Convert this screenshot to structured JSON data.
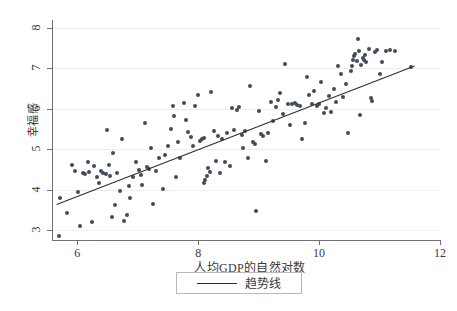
{
  "chart_data": {
    "type": "scatter",
    "title": "",
    "xlabel": "人均GDP的自然对数",
    "ylabel": "幸福感",
    "xlim": [
      5.6,
      12
    ],
    "ylim": [
      2.75,
      8.15
    ],
    "xticks": [
      6,
      8,
      10,
      12
    ],
    "yticks": [
      3,
      4,
      5,
      6,
      7,
      8
    ],
    "xtick_labels": [
      "6",
      "8",
      "10",
      "12"
    ],
    "ytick_labels": [
      "3",
      "4",
      "5",
      "6",
      "7",
      "8"
    ],
    "grid": "horizontal",
    "legend_position": "below-axis",
    "point_color": "#434a5a",
    "line_color": "#2e2e2e",
    "grid_color": "#ededed",
    "axis_color": "#6f6f6f",
    "series": [
      {
        "name": "观测值",
        "type": "scatter",
        "points": [
          [
            5.72,
            3.78
          ],
          [
            5.7,
            2.85
          ],
          [
            5.83,
            3.41
          ],
          [
            5.92,
            4.61
          ],
          [
            5.96,
            4.47
          ],
          [
            6.02,
            3.94
          ],
          [
            6.05,
            3.09
          ],
          [
            6.1,
            4.41
          ],
          [
            6.13,
            4.38
          ],
          [
            6.18,
            4.68
          ],
          [
            6.2,
            4.44
          ],
          [
            6.25,
            3.19
          ],
          [
            6.28,
            4.59
          ],
          [
            6.33,
            4.3
          ],
          [
            6.36,
            4.15
          ],
          [
            6.4,
            4.45
          ],
          [
            6.43,
            4.41
          ],
          [
            6.48,
            4.38
          ],
          [
            6.5,
            5.47
          ],
          [
            6.52,
            4.62
          ],
          [
            6.55,
            4.34
          ],
          [
            6.58,
            3.32
          ],
          [
            6.6,
            4.9
          ],
          [
            6.63,
            3.61
          ],
          [
            6.66,
            4.42
          ],
          [
            6.7,
            3.97
          ],
          [
            6.74,
            5.25
          ],
          [
            6.78,
            3.23
          ],
          [
            6.82,
            3.37
          ],
          [
            6.86,
            4.08
          ],
          [
            6.88,
            3.79
          ],
          [
            6.92,
            4.3
          ],
          [
            6.98,
            4.68
          ],
          [
            7.02,
            4.48
          ],
          [
            7.05,
            4.37
          ],
          [
            7.08,
            4.12
          ],
          [
            7.12,
            5.64
          ],
          [
            7.15,
            4.56
          ],
          [
            7.18,
            4.5
          ],
          [
            7.22,
            5.02
          ],
          [
            7.25,
            3.65
          ],
          [
            7.3,
            4.46
          ],
          [
            7.35,
            4.79
          ],
          [
            7.42,
            4.01
          ],
          [
            7.46,
            4.86
          ],
          [
            7.5,
            5.08
          ],
          [
            7.55,
            5.51
          ],
          [
            7.58,
            6.08
          ],
          [
            7.6,
            5.83
          ],
          [
            7.63,
            4.31
          ],
          [
            7.66,
            5.18
          ],
          [
            7.7,
            4.77
          ],
          [
            7.76,
            6.14
          ],
          [
            7.8,
            5.73
          ],
          [
            7.84,
            5.43
          ],
          [
            7.88,
            5.29
          ],
          [
            7.92,
            5.09
          ],
          [
            7.95,
            6.07
          ],
          [
            8.0,
            6.33
          ],
          [
            8.03,
            5.21
          ],
          [
            8.06,
            5.24
          ],
          [
            8.09,
            5.27
          ],
          [
            8.1,
            4.17
          ],
          [
            8.12,
            4.24
          ],
          [
            8.14,
            4.33
          ],
          [
            8.17,
            4.54
          ],
          [
            8.19,
            4.43
          ],
          [
            8.22,
            6.42
          ],
          [
            8.26,
            5.44
          ],
          [
            8.3,
            4.7
          ],
          [
            8.33,
            5.33
          ],
          [
            8.36,
            4.4
          ],
          [
            8.4,
            5.26
          ],
          [
            8.44,
            4.69
          ],
          [
            8.48,
            5.41
          ],
          [
            8.52,
            4.58
          ],
          [
            8.56,
            6.01
          ],
          [
            8.6,
            5.48
          ],
          [
            8.64,
            5.98
          ],
          [
            8.68,
            6.05
          ],
          [
            8.72,
            5.34
          ],
          [
            8.75,
            5.02
          ],
          [
            8.78,
            5.46
          ],
          [
            8.82,
            4.77
          ],
          [
            8.86,
            6.56
          ],
          [
            8.9,
            5.17
          ],
          [
            8.94,
            5.13
          ],
          [
            8.96,
            3.47
          ],
          [
            9.0,
            5.94
          ],
          [
            9.04,
            5.38
          ],
          [
            9.08,
            5.33
          ],
          [
            9.12,
            4.7
          ],
          [
            9.16,
            5.39
          ],
          [
            9.2,
            6.18
          ],
          [
            9.24,
            5.71
          ],
          [
            9.28,
            6.05
          ],
          [
            9.32,
            6.21
          ],
          [
            9.36,
            6.38
          ],
          [
            9.4,
            5.88
          ],
          [
            9.44,
            7.12
          ],
          [
            9.48,
            6.13
          ],
          [
            9.52,
            5.61
          ],
          [
            9.56,
            6.12
          ],
          [
            9.6,
            6.14
          ],
          [
            9.64,
            6.09
          ],
          [
            9.68,
            6.06
          ],
          [
            9.72,
            5.26
          ],
          [
            9.76,
            5.66
          ],
          [
            9.8,
            6.8
          ],
          [
            9.84,
            6.34
          ],
          [
            9.88,
            6.11
          ],
          [
            9.92,
            6.43
          ],
          [
            9.96,
            6.08
          ],
          [
            10.0,
            6.13
          ],
          [
            10.04,
            6.67
          ],
          [
            10.08,
            5.89
          ],
          [
            10.12,
            6.03
          ],
          [
            10.16,
            6.31
          ],
          [
            10.2,
            5.93
          ],
          [
            10.24,
            6.5
          ],
          [
            10.28,
            6.18
          ],
          [
            10.32,
            7.05
          ],
          [
            10.36,
            6.86
          ],
          [
            10.4,
            6.3
          ],
          [
            10.44,
            6.62
          ],
          [
            10.48,
            5.4
          ],
          [
            10.52,
            6.94
          ],
          [
            10.54,
            7.06
          ],
          [
            10.56,
            7.22
          ],
          [
            10.58,
            7.3
          ],
          [
            10.6,
            7.35
          ],
          [
            10.62,
            7.18
          ],
          [
            10.64,
            7.72
          ],
          [
            10.66,
            7.44
          ],
          [
            10.68,
            5.85
          ],
          [
            10.7,
            7.09
          ],
          [
            10.72,
            7.26
          ],
          [
            10.74,
            7.21
          ],
          [
            10.76,
            7.34
          ],
          [
            10.78,
            7.15
          ],
          [
            10.82,
            7.48
          ],
          [
            10.86,
            6.27
          ],
          [
            10.88,
            6.2
          ],
          [
            10.92,
            7.4
          ],
          [
            10.96,
            7.46
          ],
          [
            11.0,
            6.86
          ],
          [
            11.04,
            7.16
          ],
          [
            11.1,
            7.43
          ],
          [
            11.18,
            7.46
          ],
          [
            11.26,
            7.42
          ],
          [
            11.52,
            7.03
          ]
        ]
      },
      {
        "name": "趋势线",
        "type": "line",
        "points": [
          [
            5.66,
            3.63
          ],
          [
            11.58,
            7.06
          ]
        ]
      }
    ]
  },
  "legend": {
    "entries": [
      {
        "label": "趋势线",
        "marker": "line",
        "color": "#2e2e2e"
      }
    ]
  }
}
